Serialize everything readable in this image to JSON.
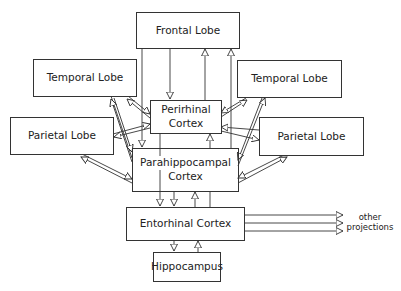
{
  "nodes": {
    "frontal": {
      "label": "Frontal Lobe"
    },
    "temporal_left": {
      "label": "Temporal Lobe"
    },
    "temporal_right": {
      "label": "Temporal Lobe"
    },
    "parietal_left": {
      "label": "Parietal Lobe"
    },
    "parietal_right": {
      "label": "Parietal Lobe"
    },
    "perirhinal": {
      "line1": "Perirhinal",
      "line2": "Cortex"
    },
    "parahippocampal": {
      "line1": "Parahippocampal",
      "line2": "Cortex"
    },
    "entorhinal": {
      "label": "Entorhinal Cortex"
    },
    "hippocampus": {
      "label": "Hippocampus"
    }
  },
  "annotations": {
    "other_projections_line1": "other",
    "other_projections_line2": "projections"
  },
  "colors": {
    "stroke": "#333333",
    "background": "#ffffff"
  }
}
